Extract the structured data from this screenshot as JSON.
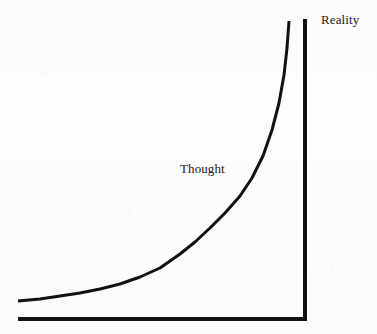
{
  "figure": {
    "background_color": "#fdfdfc",
    "ink_color": "#111111",
    "labels": {
      "curve_label": "Thought",
      "axis_label": "Reality"
    }
  },
  "chart_data": {
    "type": "line",
    "title": "",
    "subtitle": "",
    "xlabel": "",
    "ylabel": "",
    "grid": false,
    "legend": "none",
    "axis_style": "open L-frame with vertical asymptote line",
    "xlim": [
      0,
      1
    ],
    "ylim": [
      0,
      1
    ],
    "annotations": [
      {
        "text": "Thought",
        "x_px": 180,
        "y_px": 162,
        "role": "curve-label",
        "font": "serif",
        "font_size_px": 13
      },
      {
        "text": "Reality",
        "x_px": 321,
        "y_px": 13,
        "role": "vertical-axis-label",
        "font": "serif",
        "font_size_px": 13
      }
    ],
    "series": [
      {
        "name": "Thought",
        "kind": "exponential-asymptotic curve",
        "stroke_color": "#111111",
        "stroke_width_px": 3,
        "asymptote_x_px": 290,
        "points_px": [
          [
            18,
            301
          ],
          [
            40,
            299
          ],
          [
            60,
            296
          ],
          [
            80,
            293
          ],
          [
            100,
            289
          ],
          [
            120,
            284
          ],
          [
            140,
            277
          ],
          [
            160,
            268
          ],
          [
            180,
            254
          ],
          [
            195,
            242
          ],
          [
            210,
            228
          ],
          [
            225,
            213
          ],
          [
            240,
            196
          ],
          [
            252,
            178
          ],
          [
            263,
            156
          ],
          [
            272,
            130
          ],
          [
            279,
            103
          ],
          [
            284,
            75
          ],
          [
            287,
            48
          ],
          [
            289,
            21
          ]
        ]
      }
    ],
    "axes": [
      {
        "name": "baseline",
        "orientation": "horizontal",
        "from_px": [
          18,
          319
        ],
        "to_px": [
          307,
          319
        ],
        "stroke_color": "#111111",
        "stroke_width_px": 4
      },
      {
        "name": "reality-line",
        "orientation": "vertical",
        "from_px": [
          305,
          19
        ],
        "to_px": [
          305,
          321
        ],
        "stroke_color": "#111111",
        "stroke_width_px": 4
      }
    ]
  }
}
